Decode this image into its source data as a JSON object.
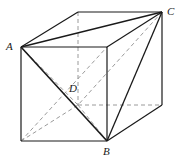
{
  "figure": {
    "kind": "geometry-diagram",
    "canvas": {
      "width": 179,
      "height": 166,
      "background": "#ffffff"
    },
    "colors": {
      "solid_edge": "#1a1a1a",
      "hidden_edge": "#9a9a9a",
      "label_text": "#1a1a1a"
    },
    "labels": [
      {
        "id": "A",
        "text": "A",
        "x": 11,
        "y": 46
      },
      {
        "id": "B",
        "text": "B",
        "x": 107,
        "y": 151
      },
      {
        "id": "C",
        "text": "C",
        "x": 171,
        "y": 11
      },
      {
        "id": "D",
        "text": "D",
        "x": 74,
        "y": 88
      }
    ],
    "vertices": {
      "front_top_left": {
        "x": 21,
        "y": 47
      },
      "front_top_right": {
        "x": 107,
        "y": 47
      },
      "front_bot_right": {
        "x": 107,
        "y": 141
      },
      "front_bot_left": {
        "x": 21,
        "y": 141
      },
      "back_top_left": {
        "x": 78,
        "y": 12
      },
      "back_top_right": {
        "x": 162,
        "y": 12
      },
      "back_bot_right": {
        "x": 162,
        "y": 105
      },
      "back_bot_left": {
        "x": 78,
        "y": 105
      }
    },
    "named_points": {
      "A": {
        "x": 21,
        "y": 47,
        "at": "front_top_left"
      },
      "B": {
        "x": 107,
        "y": 141,
        "at": "front_bot_right"
      },
      "C": {
        "x": 162,
        "y": 12,
        "at": "back_top_right"
      },
      "D": {
        "x": 78,
        "y": 105,
        "at": "back_bot_left"
      }
    },
    "edges_solid": [
      {
        "name": "front-top",
        "x1": 21,
        "y1": 47,
        "x2": 107,
        "y2": 47
      },
      {
        "name": "front-right",
        "x1": 107,
        "y1": 47,
        "x2": 107,
        "y2": 141
      },
      {
        "name": "front-bottom",
        "x1": 21,
        "y1": 141,
        "x2": 107,
        "y2": 141
      },
      {
        "name": "front-left",
        "x1": 21,
        "y1": 47,
        "x2": 21,
        "y2": 141
      },
      {
        "name": "back-top",
        "x1": 78,
        "y1": 12,
        "x2": 162,
        "y2": 12
      },
      {
        "name": "back-right",
        "x1": 162,
        "y1": 12,
        "x2": 162,
        "y2": 105
      },
      {
        "name": "top-left-diag",
        "x1": 21,
        "y1": 47,
        "x2": 78,
        "y2": 12
      },
      {
        "name": "top-right-diag",
        "x1": 107,
        "y1": 47,
        "x2": 162,
        "y2": 12
      },
      {
        "name": "bottom-right-diag",
        "x1": 107,
        "y1": 141,
        "x2": 162,
        "y2": 105
      }
    ],
    "edges_hidden": [
      {
        "name": "back-left-vertical",
        "x1": 78,
        "y1": 12,
        "x2": 78,
        "y2": 105
      },
      {
        "name": "back-bottom",
        "x1": 78,
        "y1": 105,
        "x2": 162,
        "y2": 105
      },
      {
        "name": "bottom-left-diag",
        "x1": 21,
        "y1": 141,
        "x2": 78,
        "y2": 105
      }
    ],
    "tetrahedron_edges_solid": [
      {
        "name": "AC",
        "x1": 21,
        "y1": 47,
        "x2": 162,
        "y2": 12
      },
      {
        "name": "AB",
        "x1": 21,
        "y1": 47,
        "x2": 107,
        "y2": 141
      },
      {
        "name": "CB",
        "x1": 162,
        "y1": 12,
        "x2": 107,
        "y2": 141
      }
    ],
    "tetrahedron_edges_hidden": [
      {
        "name": "AD",
        "x1": 21,
        "y1": 47,
        "x2": 78,
        "y2": 105
      },
      {
        "name": "CD",
        "x1": 162,
        "y1": 12,
        "x2": 78,
        "y2": 105
      },
      {
        "name": "DB",
        "x1": 78,
        "y1": 105,
        "x2": 107,
        "y2": 141
      }
    ],
    "extra_hidden_lines": [
      {
        "name": "A-to-back-bot-left-lower",
        "x1": 21,
        "y1": 141,
        "x2": 107,
        "y2": 47
      }
    ]
  }
}
